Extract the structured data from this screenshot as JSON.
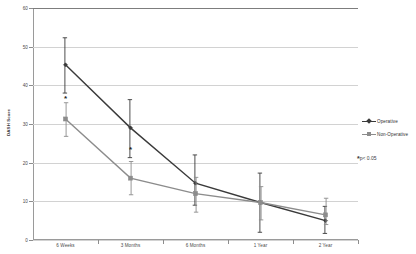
{
  "chart_data": {
    "type": "line",
    "title": "",
    "subtitle": "",
    "xlabel": "",
    "ylabel": "DASH Score",
    "categories": [
      "6 Weeks",
      "3 Months",
      "6 Months",
      "1 Year",
      "2 Year"
    ],
    "ylim": [
      0,
      60
    ],
    "yticks": [
      0,
      10,
      20,
      30,
      40,
      50,
      60
    ],
    "ytick_labels": [
      "0",
      "10",
      "20",
      "30",
      "40",
      "50",
      "60"
    ],
    "grid": "horizontal",
    "legend_position": "right",
    "series": [
      {
        "name": "Operative",
        "color": "#3a3a3a",
        "marker": "diamond",
        "values": [
          45.3,
          29.0,
          14.7,
          9.7,
          5.0
        ],
        "err_low": [
          38.0,
          21.3,
          9.0,
          2.0,
          1.7
        ],
        "err_high": [
          52.3,
          36.3,
          22.0,
          17.3,
          8.7
        ]
      },
      {
        "name": "Non-Operative",
        "color": "#8c8c8c",
        "marker": "square",
        "values": [
          31.3,
          16.0,
          12.0,
          9.7,
          6.5
        ],
        "err_low": [
          26.8,
          11.7,
          7.2,
          5.2,
          4.0
        ],
        "err_high": [
          35.5,
          20.3,
          16.2,
          13.8,
          10.8
        ]
      }
    ],
    "annotations": [
      {
        "text": "*",
        "category": "6 Weeks",
        "value": 36.5,
        "name": "significance-star-6-weeks"
      },
      {
        "text": "*",
        "category": "3 Months",
        "value": 23.3,
        "name": "significance-star-3-months"
      }
    ],
    "pvalue_note": {
      "star": "*",
      "text": "p< 0.05"
    }
  },
  "legend": {
    "items": [
      {
        "label": "Operative",
        "color": "#3a3a3a",
        "marker": "diamond"
      },
      {
        "label": "Non-Operative",
        "color": "#8c8c8c",
        "marker": "square"
      }
    ]
  },
  "axes": {
    "y_title": "DASH Score"
  }
}
